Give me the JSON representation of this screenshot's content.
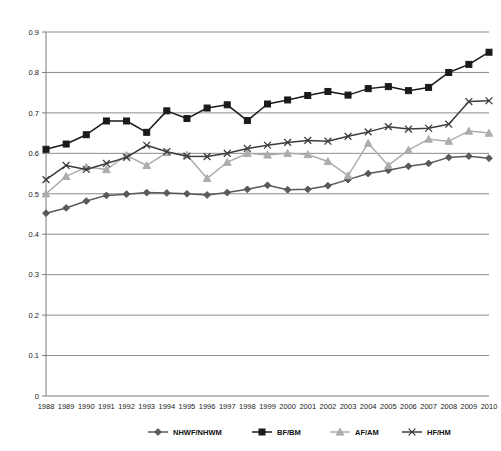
{
  "chart_data": {
    "type": "line",
    "title": "",
    "subtitle": "",
    "xlabel": "",
    "ylabel": "",
    "xlim": [
      1988,
      2010
    ],
    "ylim": [
      0,
      0.9
    ],
    "grid": true,
    "legend_position": "bottom",
    "x": [
      1988,
      1989,
      1990,
      1991,
      1992,
      1993,
      1994,
      1995,
      1996,
      1997,
      1998,
      1999,
      2000,
      2001,
      2002,
      2003,
      2004,
      2005,
      2006,
      2007,
      2008,
      2009,
      2010
    ],
    "xtick_labels": [
      "1988",
      "1989",
      "1990",
      "1991",
      "1992",
      "1993",
      "1994",
      "1995",
      "1996",
      "1997",
      "1998",
      "1999",
      "2000",
      "2001",
      "2002",
      "2003",
      "2004",
      "2005",
      "2006",
      "2007",
      "2008",
      "2009",
      "2010"
    ],
    "ytick_labels": [
      "0",
      "0.1",
      "0.2",
      "0.3",
      "0.4",
      "0.5",
      "0.6",
      "0.7",
      "0.8",
      "0.9"
    ],
    "ytick_values": [
      0,
      0.1,
      0.2,
      0.3,
      0.4,
      0.5,
      0.6,
      0.7,
      0.8,
      0.9
    ],
    "series": [
      {
        "name": "NHWF/NHWM",
        "color": "#595959",
        "marker": "diamond",
        "values": [
          0.452,
          0.465,
          0.482,
          0.496,
          0.499,
          0.503,
          0.502,
          0.5,
          0.497,
          0.503,
          0.511,
          0.521,
          0.51,
          0.511,
          0.52,
          0.535,
          0.55,
          0.558,
          0.568,
          0.575,
          0.59,
          0.593,
          0.588
        ]
      },
      {
        "name": "BF/BM",
        "color": "#1a1a1a",
        "marker": "square",
        "values": [
          0.61,
          0.623,
          0.646,
          0.68,
          0.68,
          0.652,
          0.705,
          0.686,
          0.712,
          0.72,
          0.681,
          0.722,
          0.732,
          0.743,
          0.753,
          0.744,
          0.76,
          0.765,
          0.755,
          0.763,
          0.8,
          0.82,
          0.85
        ]
      },
      {
        "name": "AF/AM",
        "color": "#adadad",
        "marker": "triangle",
        "values": [
          0.5,
          0.543,
          0.566,
          0.56,
          0.595,
          0.57,
          0.602,
          0.596,
          0.538,
          0.578,
          0.6,
          0.596,
          0.6,
          0.597,
          0.58,
          0.545,
          0.625,
          0.57,
          0.608,
          0.635,
          0.63,
          0.655,
          0.65
        ]
      },
      {
        "name": "HF/HM",
        "color": "#3d3d3d",
        "marker": "cross",
        "values": [
          0.535,
          0.57,
          0.56,
          0.575,
          0.59,
          0.62,
          0.604,
          0.593,
          0.592,
          0.6,
          0.612,
          0.62,
          0.627,
          0.632,
          0.63,
          0.642,
          0.653,
          0.666,
          0.66,
          0.662,
          0.672,
          0.728,
          0.73
        ]
      }
    ]
  },
  "legend": {
    "items": [
      {
        "label": "NHWF/NHWM"
      },
      {
        "label": "BF/BM"
      },
      {
        "label": "AF/AM"
      },
      {
        "label": "HF/HM"
      }
    ]
  }
}
